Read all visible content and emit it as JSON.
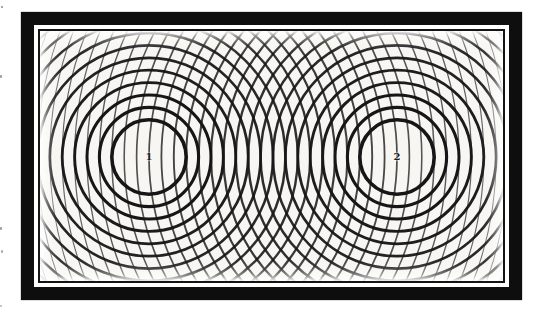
{
  "figure": {
    "type": "two-source-wave-interference-diagram",
    "sources": [
      {
        "label": "1",
        "x": 109,
        "y": 126
      },
      {
        "label": "2",
        "x": 357,
        "y": 126
      }
    ],
    "wavelength_px": 12.4,
    "ring_index_min": 3,
    "ring_index_max": 31,
    "pattern": {
      "width": 463,
      "height": 250,
      "background": "#f7f6f2"
    },
    "stroke_color": "#161616",
    "frame": {
      "outer_color": "#0e0e0e",
      "keyline_color": "#ffffff",
      "inner_rule_color": "#141414"
    }
  },
  "specks": [
    {
      "x": 1,
      "y": 6,
      "w": 2,
      "h": 2,
      "color": "#8a8a8a"
    },
    {
      "x": 0,
      "y": 75,
      "w": 2,
      "h": 3,
      "color": "#9a9a9a"
    },
    {
      "x": 0,
      "y": 227,
      "w": 2,
      "h": 3,
      "color": "#9a9a9a"
    },
    {
      "x": 1,
      "y": 250,
      "w": 2,
      "h": 3,
      "color": "#a8a8a8"
    },
    {
      "x": 0,
      "y": 305,
      "w": 2,
      "h": 2,
      "color": "#b5b5b5"
    }
  ]
}
